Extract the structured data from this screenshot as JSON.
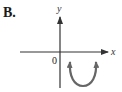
{
  "figure": {
    "option_label": "B.",
    "axes": {
      "x_label": "x",
      "y_label": "y",
      "origin_label": "0"
    },
    "curve": {
      "type": "parabola",
      "opens": "upward",
      "vertex_position": "below x-axis, right of y-axis",
      "ends": "arrows pointing upward on both sides"
    },
    "colors": {
      "axes": "#333333",
      "curve": "#555555",
      "text": "#1a1a1a"
    }
  }
}
